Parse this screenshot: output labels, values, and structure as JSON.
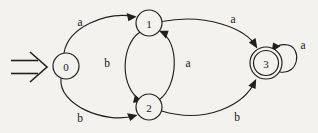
{
  "diagram": {
    "type": "state-transition-diagram",
    "background_color": "#f4f2ee",
    "line_color": "#22201e",
    "start_indicator": {
      "glyph": "double-arrow-right",
      "name": "start-arrow",
      "target_state": "0"
    },
    "states": [
      {
        "id": "0",
        "label": "0",
        "cx": 66,
        "cy": 66,
        "r": 13,
        "accepting": false
      },
      {
        "id": "1",
        "label": "1",
        "cx": 149,
        "cy": 23,
        "r": 13,
        "accepting": false
      },
      {
        "id": "2",
        "label": "2",
        "cx": 149,
        "cy": 107,
        "r": 13,
        "accepting": false
      },
      {
        "id": "3",
        "label": "3",
        "cx": 266,
        "cy": 63,
        "r": 13,
        "accepting": true,
        "outer_r": 16
      }
    ],
    "transitions": [
      {
        "from": "0",
        "to": "1",
        "label": "a",
        "label_x": 80,
        "label_y": 22
      },
      {
        "from": "0",
        "to": "2",
        "label": "b",
        "label_x": 80,
        "label_y": 118
      },
      {
        "from": "1",
        "to": "2",
        "label": "b",
        "label_x": 107,
        "label_y": 63
      },
      {
        "from": "2",
        "to": "1",
        "label": "a",
        "label_x": 188,
        "label_y": 63
      },
      {
        "from": "1",
        "to": "3",
        "label": "a",
        "label_x": 233,
        "label_y": 19
      },
      {
        "from": "2",
        "to": "3",
        "label": "b",
        "label_x": 237,
        "label_y": 117
      },
      {
        "from": "3",
        "to": "3",
        "label": "a",
        "label_x": 303,
        "label_y": 45,
        "self_loop": true
      }
    ]
  }
}
